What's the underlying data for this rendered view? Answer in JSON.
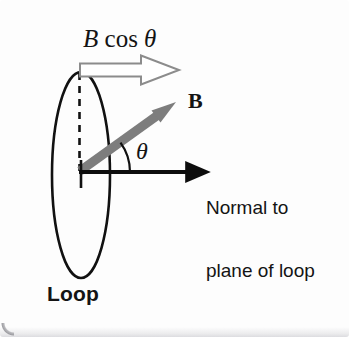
{
  "figure": {
    "background_color": "#fdfdfd",
    "width": 349,
    "height": 337
  },
  "labels": {
    "b_cos_theta": {
      "symbol": "B",
      "function": " cos ",
      "angle": "θ",
      "full_text": "B cos θ"
    },
    "b_vector": "B",
    "theta": "θ",
    "normal_line1": "Normal to",
    "normal_line2": "plane of loop",
    "loop": "Loop"
  },
  "elements": {
    "loop_ellipse": {
      "name": "loop-ellipse",
      "center_x": 81,
      "center_y": 175,
      "radius_x": 29,
      "radius_y": 103,
      "stroke": "#111111",
      "stroke_width": 2.6,
      "fill": "none"
    },
    "dashed_line": {
      "name": "loop-axis-dashed-line",
      "x": 79.5,
      "y_top": 73,
      "y_bottom": 171,
      "stroke": "#111111",
      "stroke_width": 2.6,
      "dash": "7 6"
    },
    "normal_arrow": {
      "name": "normal-arrow",
      "x_start": 79,
      "y": 172,
      "x_end": 199,
      "stroke": "#0d0d0d",
      "stroke_width": 4
    },
    "b_arrow": {
      "name": "b-field-vector-arrow",
      "x_start": 80,
      "y_start": 171,
      "x_end": 170,
      "y_end": 106,
      "color": "#7d7d7d",
      "stroke_width": 9
    },
    "b_cos_theta_arrow": {
      "name": "b-cos-theta-component-arrow",
      "x_start": 80,
      "y_center": 70,
      "shaft_x_end": 141,
      "x_tip": 179,
      "fill": "#ffffff",
      "stroke": "#8c8c8c",
      "stroke_width": 2
    },
    "angle_arc": {
      "name": "theta-angle-arc",
      "origin_x": 80,
      "origin_y": 172,
      "radius": 50,
      "angle_degrees": 36,
      "stroke": "#111111",
      "stroke_width": 2.2
    },
    "origin_vertical_tick": {
      "name": "origin-vertical-tick",
      "x": 81,
      "y_top": 160,
      "y_bottom": 186
    }
  },
  "colors": {
    "ink": "#111111",
    "field_gray": "#7d7d7d",
    "component_outline": "#8c8c8c",
    "page": "#fdfdfd"
  }
}
